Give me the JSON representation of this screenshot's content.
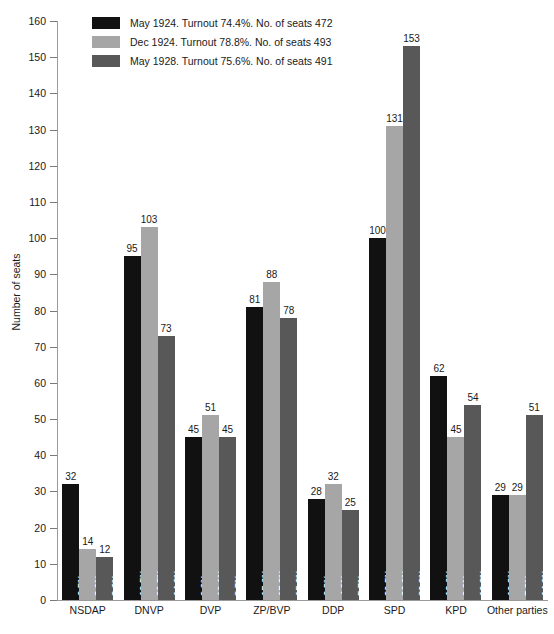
{
  "chart_data": {
    "type": "bar",
    "title": "",
    "subtitle": "",
    "xlabel": "",
    "ylabel": "Number of seats",
    "ylim": [
      0,
      160
    ],
    "ytick_step": 10,
    "grid": false,
    "legend_position": "top-left-inside",
    "categories": [
      "NSDAP",
      "DNVP",
      "DVP",
      "ZP/BVP",
      "DDP",
      "SPD",
      "KPD",
      "Other parties"
    ],
    "series": [
      {
        "name": "May 1924. Turnout 74.4%. No. of seats 472",
        "short_name": "May 1924",
        "turnout": "74.4%",
        "total_seats": 472,
        "color": "#111111",
        "values": [
          32,
          95,
          45,
          81,
          28,
          100,
          62,
          29
        ],
        "percent_labels": [
          "6.5%",
          "19.5%",
          "9.2%",
          "15.6%",
          "6.3%",
          "20.5%",
          "12.6%",
          "10.3%"
        ]
      },
      {
        "name": "Dec 1924. Turnout 78.8%. No. of seats 493",
        "short_name": "Dec 1924",
        "turnout": "78.8%",
        "total_seats": 493,
        "color": "#a6a6a6",
        "values": [
          14,
          103,
          51,
          88,
          32,
          131,
          45,
          29
        ],
        "percent_labels": [
          "3.0%",
          "20.5%",
          "10.1%",
          "17.3%",
          "4.9%",
          "26.0%",
          "9.0%",
          "7.8%"
        ]
      },
      {
        "name": "May 1928. Turnout 75.6%. No. of seats 491",
        "short_name": "May 1928",
        "turnout": "75.6%",
        "total_seats": 491,
        "color": "#585858",
        "values": [
          12,
          73,
          45,
          78,
          25,
          153,
          54,
          51
        ],
        "percent_labels": [
          "2.6%",
          "14.2%",
          "8.7%",
          "15.2%",
          "5.7%",
          "29.8%",
          "10.8%",
          "14.0%"
        ]
      }
    ],
    "ytick_labels": [
      "0",
      "10",
      "20",
      "30",
      "40",
      "50",
      "60",
      "70",
      "80",
      "90",
      "100",
      "110",
      "120",
      "130",
      "140",
      "150",
      "160"
    ]
  },
  "legend": {
    "entries": [
      {
        "label": "May 1924. Turnout 74.4%. No. of seats 472",
        "color": "#111111"
      },
      {
        "label": "Dec 1924. Turnout 78.8%. No. of seats 493",
        "color": "#a6a6a6"
      },
      {
        "label": "May 1928. Turnout 75.6%. No. of seats 491",
        "color": "#585858"
      }
    ]
  },
  "axes": {
    "y_title": "Number of seats"
  }
}
